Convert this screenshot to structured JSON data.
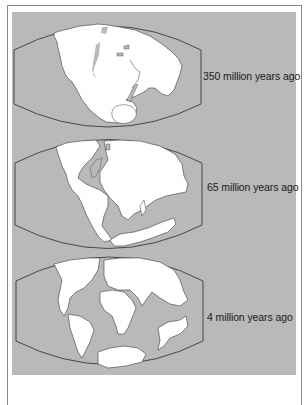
{
  "figure": {
    "colors": {
      "ocean": "#b9b9b9",
      "land": "#ffffff",
      "outline": "#3a3a3a",
      "frame": "#8a8a8a"
    },
    "panels": [
      {
        "id": "pangaea",
        "label": "350 million years ago"
      },
      {
        "id": "cretaceous",
        "label": "65 million years ago"
      },
      {
        "id": "pliocene",
        "label": "4 million years ago"
      }
    ]
  }
}
